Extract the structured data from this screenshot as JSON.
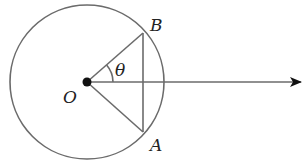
{
  "diagram": {
    "type": "geometry",
    "colors": {
      "stroke": "#6b6b6b",
      "point": "#111111",
      "text": "#222222",
      "background": "#ffffff"
    },
    "circle": {
      "cx": 87,
      "cy": 82,
      "r": 77
    },
    "points": {
      "O": {
        "x": 87,
        "y": 82,
        "label": "O"
      },
      "B": {
        "x": 143,
        "y": 33,
        "label": "B"
      },
      "A": {
        "x": 143,
        "y": 132,
        "label": "A"
      }
    },
    "segments": [
      {
        "from": "O",
        "to": "B"
      },
      {
        "from": "O",
        "to": "A"
      },
      {
        "from": "A",
        "to": "B"
      }
    ],
    "ray": {
      "from": "O",
      "to_x": 302,
      "y": 82,
      "arrow": true
    },
    "angle": {
      "vertex": "O",
      "between": [
        "ray",
        "OB"
      ],
      "label": "θ"
    },
    "labels": {
      "O": "O",
      "A": "A",
      "B": "B",
      "theta": "θ"
    }
  }
}
